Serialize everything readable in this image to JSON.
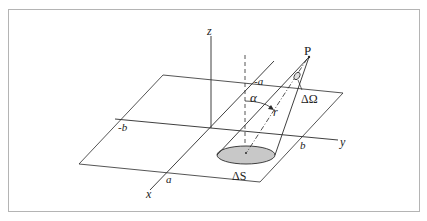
{
  "figure": {
    "colors": {
      "frame": "#b4b4b4",
      "line": "#2a2a2a",
      "ellipse_fill": "#c8c8c8"
    },
    "labels": {
      "z_axis": "z",
      "y_axis": "y",
      "x_axis": "x",
      "point": "P",
      "solid_angle": "ΔΩ",
      "angle": "α",
      "distance": "r",
      "surface_element": "ΔS",
      "neg_a": "-a",
      "pos_a": "a",
      "neg_b": "-b",
      "pos_b": "b"
    }
  }
}
